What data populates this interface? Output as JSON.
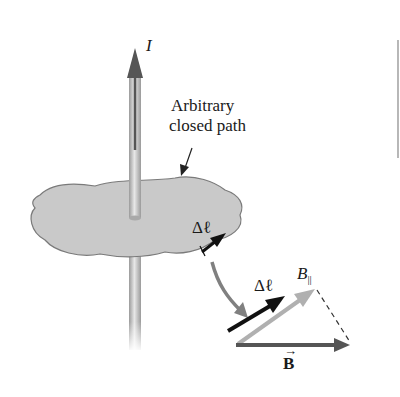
{
  "figure": {
    "current_label": "I",
    "path_label_line1": "Arbitrary",
    "path_label_line2": "closed path",
    "delta_l_upper": "Δℓ",
    "delta_l_lower": "Δℓ",
    "b_parallel_label": "B",
    "b_parallel_subscript": "||",
    "b_vector_label": "B",
    "b_vector_arrow": "→"
  },
  "colors": {
    "wire": "#b5b5b5",
    "wire_arrow": "#555555",
    "surface_fill": "#c9c9c9",
    "surface_edge": "#7a7a7a",
    "delta_l_arrow": "#111111",
    "connector_arrow": "#808080",
    "b_parallel_arrow": "#b0b0b0",
    "b_vector_arrow": "#555555"
  }
}
